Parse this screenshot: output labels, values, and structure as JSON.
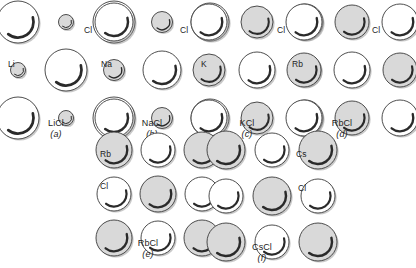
{
  "figure": {
    "type": "ionic-crystal-structure-diagram",
    "anion_color": "#ffffff",
    "cation_color": "#d9d9d9",
    "outline_color": "#3a3a3a",
    "panels": [
      {
        "id": "a",
        "formula": "LiCl",
        "tag": "(a)",
        "cation": "Li",
        "anion": "Cl",
        "cation_label": "Li",
        "anion_label": "Cl",
        "anion_radius": 21,
        "cation_radius": 7.5,
        "grid": 3,
        "layout": "anion-corner",
        "left": 8,
        "top": 14,
        "size": 96,
        "cation_label_x": 0,
        "cation_label_y": 46,
        "anion_label_x": 76,
        "anion_label_y": 12,
        "anion_leader": true
      },
      {
        "id": "b",
        "formula": "NaCl",
        "tag": "(b)",
        "cation": "Na",
        "anion": "Cl",
        "cation_label": "Na",
        "anion_label": "Cl",
        "anion_radius": 19,
        "cation_radius": 10.5,
        "grid": 3,
        "layout": "anion-corner",
        "left": 104,
        "top": 14,
        "size": 96,
        "cation_label_x": -3,
        "cation_label_y": 46,
        "anion_label_x": 76,
        "anion_label_y": 12,
        "anion_leader": true
      },
      {
        "id": "c",
        "formula": "KCl",
        "tag": "(c)",
        "cation": "K",
        "anion": "Cl",
        "cation_label": "K",
        "anion_label": "Cl",
        "anion_radius": 18,
        "cation_radius": 16,
        "grid": 3,
        "layout": "anion-corner",
        "left": 199,
        "top": 14,
        "size": 96,
        "cation_label_x": 2,
        "cation_label_y": 46,
        "anion_label_x": 78,
        "anion_label_y": 12,
        "anion_leader": true
      },
      {
        "id": "d",
        "formula": "RbCl",
        "tag": "(d)",
        "cation": "Rb",
        "anion": "Cl",
        "cation_label": "Rb",
        "anion_label": "Cl",
        "anion_radius": 18,
        "cation_radius": 17,
        "grid": 3,
        "layout": "anion-corner",
        "left": 294,
        "top": 14,
        "size": 96,
        "cation_label_x": -2,
        "cation_label_y": 46,
        "anion_label_x": 78,
        "anion_label_y": 12,
        "anion_leader": true
      },
      {
        "id": "e",
        "formula": "RbCl",
        "tag": "(e)",
        "cation": "Rb",
        "anion": "Cl",
        "cation_label": "Rb",
        "anion_label": "Cl",
        "anion_radius": 17,
        "cation_radius": 18,
        "grid": 3,
        "layout": "cation-corner",
        "left": 104,
        "top": 142,
        "size": 88,
        "cation_label_x": -4,
        "cation_label_y": 8,
        "anion_label_x": -4,
        "anion_label_y": 40,
        "anion_leader": false
      },
      {
        "id": "f",
        "formula": "CsCl",
        "tag": "(f)",
        "cation": "Cs",
        "anion": "Cl",
        "cation_label": "Cs",
        "anion_label": "Cl",
        "anion_radius": 17,
        "cation_radius": 19,
        "grid": 3,
        "layout": "cation-corner",
        "left": 216,
        "top": 142,
        "size": 92,
        "cation_label_x": 80,
        "cation_label_y": 8,
        "anion_label_x": 82,
        "anion_label_y": 42,
        "anion_leader": false
      }
    ]
  }
}
